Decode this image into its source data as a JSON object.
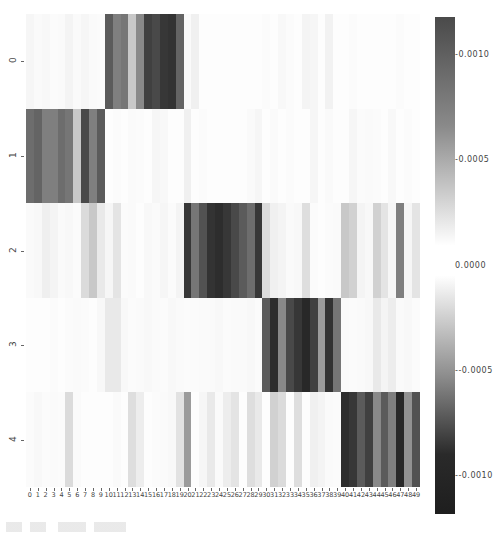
{
  "chart_data": {
    "type": "heatmap",
    "title": "",
    "xlabel": "",
    "ylabel": "",
    "row_labels": [
      "0",
      "1",
      "2",
      "3",
      "4"
    ],
    "col_labels": [
      "0",
      "1",
      "2",
      "3",
      "4",
      "5",
      "6",
      "7",
      "8",
      "9",
      "10",
      "11",
      "12",
      "13",
      "14",
      "15",
      "16",
      "17",
      "18",
      "19",
      "20",
      "21",
      "22",
      "23",
      "24",
      "25",
      "26",
      "27",
      "28",
      "29",
      "30",
      "31",
      "32",
      "33",
      "34",
      "35",
      "36",
      "37",
      "38",
      "39",
      "40",
      "41",
      "42",
      "43",
      "44",
      "45",
      "46",
      "47",
      "48",
      "49"
    ],
    "value_scale": 0.0001,
    "values": [
      [
        0.5,
        0.3,
        0.4,
        0.2,
        0.3,
        0.6,
        0.3,
        0.5,
        0.3,
        0.2,
        9.0,
        7.0,
        7.5,
        3.0,
        6.5,
        10.5,
        10.0,
        11.0,
        11.2,
        8.5,
        0.3,
        0.8,
        0.1,
        0.1,
        0.1,
        0.1,
        0.1,
        0.1,
        0.1,
        0.1,
        0.2,
        0.1,
        0.4,
        0.2,
        0.1,
        0.6,
        0.5,
        0.1,
        0.7,
        0.1,
        0.1,
        0.2,
        0.1,
        0.1,
        0.1,
        0.1,
        0.1,
        0.2,
        0.1,
        0.1
      ],
      [
        8.0,
        8.5,
        7.0,
        7.0,
        8.0,
        7.5,
        3.0,
        10.0,
        7.0,
        9.0,
        0.1,
        0.2,
        0.1,
        0.3,
        0.2,
        0.1,
        0.5,
        0.4,
        0.1,
        0.1,
        0.8,
        0.1,
        0.2,
        0.1,
        0.1,
        0.1,
        0.1,
        0.1,
        0.3,
        0.5,
        0.1,
        0.3,
        0.1,
        0.2,
        0.1,
        0.1,
        0.5,
        0.1,
        0.3,
        0.1,
        0.1,
        0.5,
        0.2,
        0.3,
        0.2,
        0.1,
        0.4,
        0.1,
        0.2,
        0.1
      ],
      [
        0.3,
        0.4,
        0.9,
        0.6,
        0.3,
        0.4,
        0.2,
        2.0,
        3.0,
        1.2,
        0.5,
        1.5,
        0.2,
        0.3,
        0.1,
        0.4,
        0.3,
        0.5,
        0.2,
        0.6,
        -11.0,
        -7.5,
        -9.5,
        -11.2,
        -11.5,
        -11.0,
        -10.0,
        -9.0,
        -8.0,
        -11.0,
        -2.0,
        -0.8,
        -0.6,
        -0.3,
        -0.4,
        -1.8,
        -0.2,
        -0.1,
        -0.2,
        -0.3,
        -3.0,
        -2.5,
        -0.6,
        -0.4,
        -2.5,
        -1.5,
        -0.5,
        -7.0,
        -0.5,
        -1.5
      ],
      [
        0.1,
        0.1,
        0.1,
        0.2,
        0.1,
        0.2,
        0.3,
        0.2,
        0.1,
        0.4,
        1.2,
        1.2,
        0.4,
        0.2,
        0.3,
        0.4,
        0.3,
        0.2,
        0.4,
        0.3,
        0.2,
        0.2,
        0.3,
        0.3,
        0.4,
        0.2,
        0.3,
        0.3,
        0.4,
        0.2,
        -9.0,
        -11.5,
        -6.5,
        -10.0,
        -11.0,
        -11.8,
        -10.5,
        -5.5,
        -11.2,
        -7.5,
        -0.3,
        -0.2,
        -0.3,
        -0.4,
        -1.2,
        -0.6,
        -1.0,
        -0.3,
        -0.4,
        -0.2
      ],
      [
        0.2,
        0.4,
        0.2,
        0.3,
        0.2,
        2.0,
        0.3,
        0.1,
        0.1,
        0.1,
        0.1,
        0.3,
        0.1,
        1.8,
        1.0,
        0.1,
        0.2,
        0.3,
        0.4,
        1.6,
        5.5,
        0.1,
        0.5,
        1.2,
        0.3,
        1.0,
        1.5,
        0.1,
        1.8,
        1.2,
        0.1,
        2.5,
        2.0,
        0.1,
        1.8,
        0.1,
        0.8,
        0.6,
        0.3,
        0.2,
        -11.5,
        -11.0,
        -9.0,
        -10.5,
        -6.5,
        -9.0,
        -7.0,
        -11.8,
        -6.0,
        -9.5
      ]
    ],
    "colorbar": {
      "ticks": [
        "0.0010",
        "0.0005",
        "0.0000",
        "-0.0005",
        "-0.0010"
      ],
      "tick_values": [
        0.001,
        0.0005,
        0.0,
        -0.0005,
        -0.001
      ],
      "range": [
        -0.00118,
        0.00118
      ],
      "colormap": "dark-white-dark (diverging grayscale)"
    },
    "grid": false,
    "legend_position": "right"
  },
  "colors": {
    "extreme": "#2b2b2b",
    "center": "#ffffff"
  }
}
